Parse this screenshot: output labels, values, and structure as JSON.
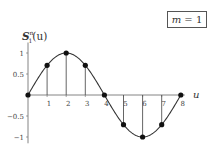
{
  "chart_data": {
    "type": "line",
    "title": "",
    "xlabel": "u",
    "ylabel": "S_1^n(u)",
    "ylabel_parts": {
      "symbol": "S",
      "superscript": "n",
      "subscript": "1",
      "argument": "(u)"
    },
    "legend": {
      "label": "m = 1",
      "var": "m",
      "eq": " = 1",
      "position": "top-right"
    },
    "x": [
      0,
      1,
      2,
      3,
      4,
      5,
      6,
      7,
      8
    ],
    "series": [
      {
        "name": "samples",
        "style": "stem-with-markers",
        "values": [
          0,
          0.707,
          1,
          0.707,
          0,
          -0.707,
          -1,
          -0.707,
          0
        ]
      },
      {
        "name": "continuous",
        "style": "smooth-curve",
        "function": "sin(pi*u/4)"
      }
    ],
    "xticks": [
      "1",
      "2",
      "3",
      "4",
      "5",
      "6",
      "7",
      "8"
    ],
    "yticks": [
      "1",
      "0.5",
      "-0.5",
      "-1"
    ],
    "xlim": [
      0,
      8
    ],
    "ylim": [
      -1.1,
      1.1
    ],
    "grid": false,
    "colors": {
      "line": "#333333",
      "stem": "#555555",
      "marker": "#111111",
      "axis": "#666666"
    }
  },
  "labels": {
    "legend_var": "m",
    "legend_eq": " = 1",
    "ylabel_symbol": "S",
    "ylabel_sup": "n",
    "ylabel_sub": "1",
    "ylabel_arg": "(u)",
    "xlabel": "u"
  }
}
